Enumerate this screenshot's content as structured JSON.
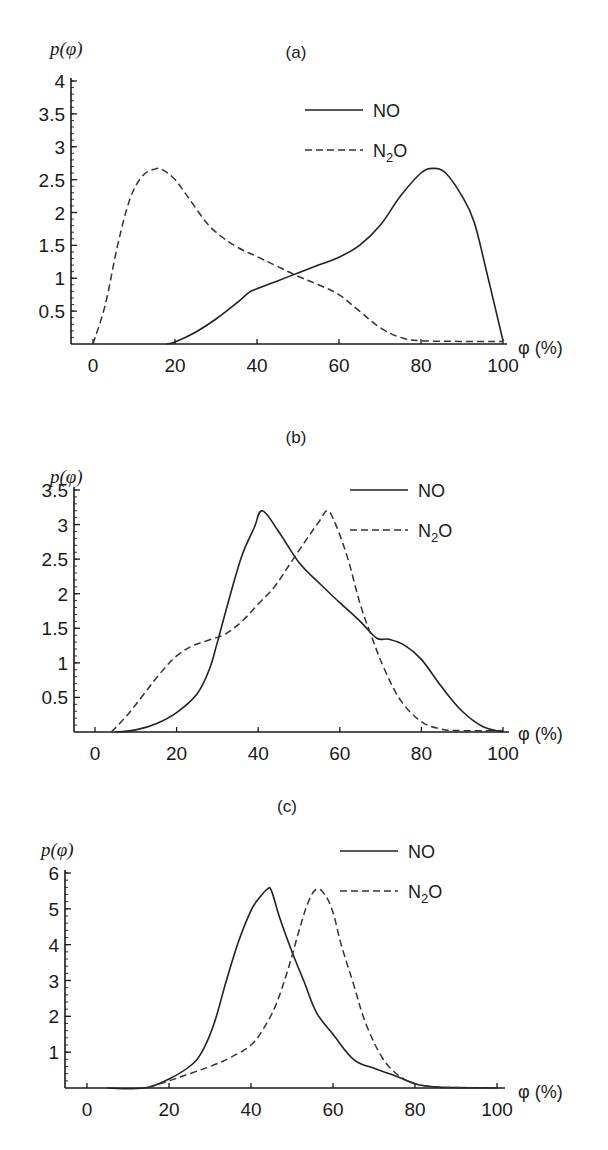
{
  "chart_data": [
    {
      "type": "line",
      "panel_label": "(a)",
      "title": "(a)",
      "xlabel": "φ (%)",
      "ylabel": "p(φ)",
      "xlim": [
        0,
        100
      ],
      "ylim": [
        0,
        4
      ],
      "x_ticks": [
        0,
        20,
        40,
        60,
        80,
        100
      ],
      "y_ticks": [
        0.5,
        1,
        1.5,
        2,
        2.5,
        3,
        3.5,
        4
      ],
      "y_tick_labels": [
        "0.5",
        "1",
        "1.5",
        "2",
        "2.5",
        "3",
        "3.5",
        "4"
      ],
      "grid": false,
      "legend_position": "upper right",
      "series": [
        {
          "name": "NO",
          "style": "solid",
          "x": [
            18,
            20,
            25,
            30,
            35,
            38,
            40,
            45,
            50,
            55,
            60,
            65,
            70,
            75,
            80,
            83,
            86,
            90,
            93,
            96,
            100
          ],
          "values": [
            0.0,
            0.03,
            0.18,
            0.38,
            0.62,
            0.78,
            0.84,
            0.96,
            1.08,
            1.2,
            1.32,
            1.5,
            1.8,
            2.25,
            2.6,
            2.67,
            2.6,
            2.25,
            1.85,
            1.1,
            0.05
          ]
        },
        {
          "name": "N₂O",
          "style": "dashed",
          "x": [
            0,
            3,
            6,
            9,
            12,
            15,
            17,
            20,
            23,
            27,
            30,
            35,
            40,
            45,
            50,
            55,
            60,
            65,
            70,
            75,
            80,
            90,
            100
          ],
          "values": [
            0.0,
            0.6,
            1.5,
            2.2,
            2.55,
            2.66,
            2.65,
            2.5,
            2.25,
            1.9,
            1.7,
            1.48,
            1.33,
            1.18,
            1.03,
            0.9,
            0.75,
            0.5,
            0.25,
            0.1,
            0.05,
            0.04,
            0.04
          ]
        }
      ]
    },
    {
      "type": "line",
      "panel_label": "(b)",
      "title": "(b)",
      "xlabel": "φ (%)",
      "ylabel": "p(φ)",
      "xlim": [
        0,
        100
      ],
      "ylim": [
        0,
        3.5
      ],
      "x_ticks": [
        0,
        20,
        40,
        60,
        80,
        100
      ],
      "y_ticks": [
        0.5,
        1,
        1.5,
        2,
        2.5,
        3,
        3.5
      ],
      "y_tick_labels": [
        "0.5",
        "1",
        "1.5",
        "2",
        "2.5",
        "3",
        "3.5"
      ],
      "grid": false,
      "legend_position": "upper right",
      "series": [
        {
          "name": "NO",
          "style": "solid",
          "x": [
            5,
            10,
            15,
            20,
            25,
            28,
            30,
            33,
            36,
            39,
            41,
            45,
            50,
            55,
            60,
            65,
            69,
            72,
            76,
            80,
            85,
            90,
            95,
            100
          ],
          "values": [
            0.0,
            0.03,
            0.12,
            0.28,
            0.55,
            0.9,
            1.3,
            1.95,
            2.55,
            2.95,
            3.2,
            2.9,
            2.45,
            2.15,
            1.87,
            1.6,
            1.36,
            1.34,
            1.25,
            1.05,
            0.65,
            0.3,
            0.08,
            0.0
          ]
        },
        {
          "name": "N₂O",
          "style": "dashed",
          "x": [
            4,
            8,
            12,
            16,
            20,
            24,
            28,
            32,
            36,
            40,
            44,
            48,
            52,
            55,
            57,
            59,
            62,
            65,
            68,
            71,
            75,
            80,
            85,
            90,
            100
          ],
          "values": [
            0.0,
            0.25,
            0.55,
            0.85,
            1.1,
            1.25,
            1.33,
            1.42,
            1.6,
            1.85,
            2.1,
            2.45,
            2.8,
            3.05,
            3.2,
            3.0,
            2.5,
            1.85,
            1.35,
            0.9,
            0.45,
            0.15,
            0.04,
            0.02,
            0.02
          ]
        }
      ]
    },
    {
      "type": "line",
      "panel_label": "(c)",
      "title": "(c)",
      "xlabel": "φ (%)",
      "ylabel": "p(φ)",
      "xlim": [
        0,
        100
      ],
      "ylim": [
        0,
        6
      ],
      "x_ticks": [
        0,
        20,
        40,
        60,
        80,
        100
      ],
      "y_ticks": [
        1,
        2,
        3,
        4,
        5,
        6
      ],
      "y_tick_labels": [
        "1",
        "2",
        "3",
        "4",
        "5",
        "6"
      ],
      "grid": false,
      "legend_position": "upper right",
      "series": [
        {
          "name": "NO",
          "style": "solid",
          "x": [
            5,
            10,
            15,
            20,
            25,
            28,
            31,
            34,
            37,
            40,
            42,
            44,
            45,
            47,
            50,
            53,
            56,
            60,
            65,
            70,
            75,
            80,
            85,
            90,
            100
          ],
          "values": [
            0.0,
            -0.02,
            0.02,
            0.25,
            0.6,
            1.0,
            1.8,
            3.0,
            4.1,
            4.95,
            5.3,
            5.55,
            5.5,
            4.75,
            3.8,
            2.95,
            2.1,
            1.5,
            0.8,
            0.55,
            0.35,
            0.12,
            0.03,
            0.01,
            0.0
          ]
        },
        {
          "name": "N₂O",
          "style": "dashed",
          "x": [
            15,
            20,
            25,
            30,
            35,
            40,
            43,
            46,
            49,
            52,
            54,
            56,
            58,
            60,
            62,
            65,
            68,
            72,
            76,
            80,
            85,
            90,
            100
          ],
          "values": [
            0.02,
            0.2,
            0.4,
            0.6,
            0.85,
            1.2,
            1.65,
            2.3,
            3.3,
            4.5,
            5.2,
            5.55,
            5.4,
            4.9,
            4.0,
            2.9,
            1.8,
            0.85,
            0.35,
            0.12,
            0.03,
            0.01,
            0.0
          ]
        }
      ]
    }
  ],
  "panels": [
    {
      "label": "(a)",
      "y_axis_title": "p(φ)",
      "x_axis_unit": "φ (%)",
      "legend": [
        {
          "name": "NO",
          "text": "NO"
        },
        {
          "name": "N2O",
          "main": "N",
          "sub": "2",
          "tail": "O"
        }
      ]
    },
    {
      "label": "(b)",
      "y_axis_title": "p(φ)",
      "x_axis_unit": "φ (%)",
      "legend": [
        {
          "name": "NO",
          "text": "NO"
        },
        {
          "name": "N2O",
          "main": "N",
          "sub": "2",
          "tail": "O"
        }
      ]
    },
    {
      "label": "(c)",
      "y_axis_title": "p(φ)",
      "x_axis_unit": "φ (%)",
      "legend": [
        {
          "name": "NO",
          "text": "NO"
        },
        {
          "name": "N2O",
          "main": "N",
          "sub": "2",
          "tail": "O"
        }
      ]
    }
  ],
  "x_tick_labels": [
    "0",
    "20",
    "40",
    "60",
    "80",
    "100"
  ]
}
